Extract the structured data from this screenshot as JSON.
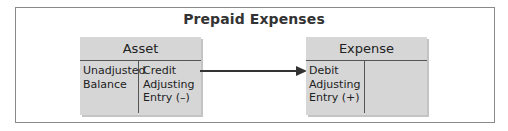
{
  "title": "Prepaid Expenses",
  "accounts": [
    {
      "name": "Asset",
      "left": "Unadjusted\nBalance",
      "right": "Credit\nAdjusting\nEntry (–)"
    },
    {
      "name": "Expense",
      "left": "Debit\nAdjusting\nEntry (+)",
      "right": ""
    }
  ],
  "arrow": {
    "from": "Asset credit adjusting entry",
    "to": "Expense debit adjusting entry"
  },
  "colors": {
    "box_fill": "#d6d6d6",
    "line": "#333333",
    "frame": "#8a8a8a"
  }
}
